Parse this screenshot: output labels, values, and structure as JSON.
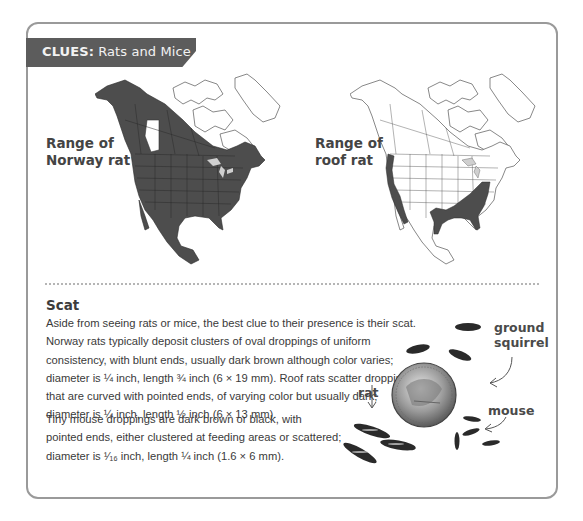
{
  "header": {
    "banner_prefix": "CLUES:",
    "banner_title": " Rats and Mice",
    "banner_color": "#5c5c5c"
  },
  "maps": [
    {
      "id": "norway-rat",
      "label_line1": "Range of",
      "label_line2": "Norway rat",
      "range_fill": "#4d4d4d",
      "coverage": "Nearly all of North America except far northern Canada and a region of Alberta"
    },
    {
      "id": "roof-rat",
      "label_line1": "Range of",
      "label_line2": "roof rat",
      "range_fill": "#4d4d4d",
      "coverage": "Pacific coast and southeastern United States / Gulf coast"
    }
  ],
  "scat": {
    "title": "Scat",
    "paragraph1": [
      "Aside from seeing rats or mice, the best clue to their presence is their scat.",
      "Norway rats typically deposit clusters of oval droppings of uniform",
      "consistency, with blunt ends, usually dark brown although color varies;",
      "diameter is ¼ inch, length ¾ inch (6 × 19 mm). Roof rats scatter droppings",
      "that are curved with pointed ends, of varying color but usually dark;",
      "diameter is ¼ inch, length ½ inch (6 × 13 mm)."
    ],
    "paragraph2": [
      "Tiny mouse droppings are dark brown or black, with",
      "pointed ends, either clustered at feeding areas or scattered;",
      "diameter is ¹⁄₁₆ inch, length ¼ inch (1.6 × 6 mm)."
    ]
  },
  "illustration": {
    "labels": {
      "ground_squirrel_line1": "ground",
      "ground_squirrel_line2": "squirrel",
      "rat": "rat",
      "mouse": "mouse"
    }
  }
}
